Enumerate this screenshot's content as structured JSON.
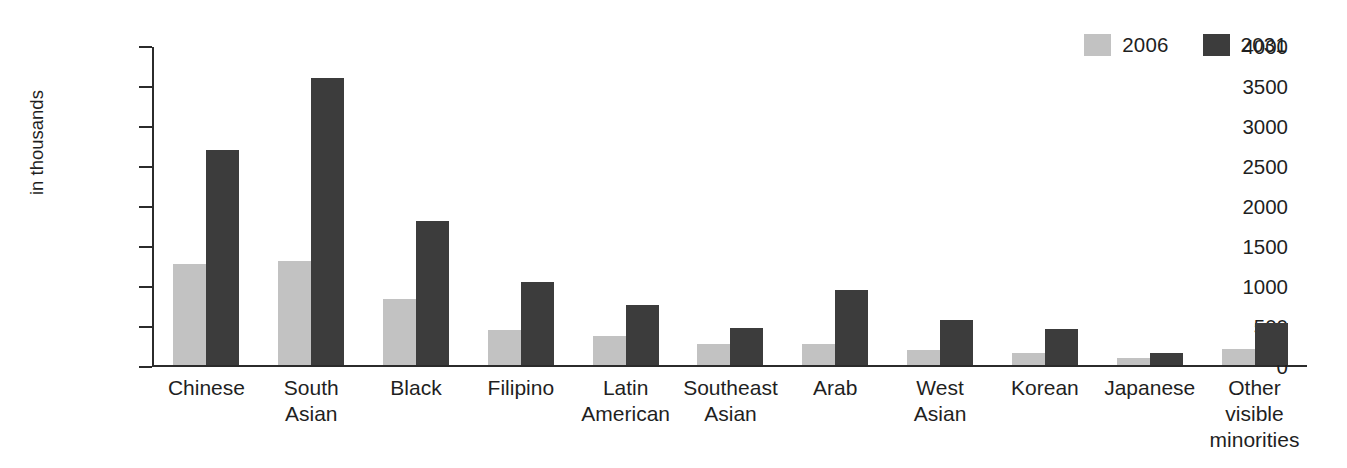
{
  "chart_data": {
    "type": "bar",
    "title": "",
    "xlabel": "",
    "ylabel": "in thousands",
    "ylim": [
      0,
      4000
    ],
    "yticks": [
      0,
      500,
      1000,
      1500,
      2000,
      2500,
      3000,
      3500,
      4000
    ],
    "grid": false,
    "legend_position": "top-right",
    "categories": [
      "Chinese",
      "South Asian",
      "Black",
      "Filipino",
      "Latin American",
      "Southeast Asian",
      "Arab",
      "West Asian",
      "Korean",
      "Japanese",
      "Other visible minorities"
    ],
    "category_lines": [
      [
        "Chinese"
      ],
      [
        "South",
        "Asian"
      ],
      [
        "Black"
      ],
      [
        "Filipino"
      ],
      [
        "Latin",
        "American"
      ],
      [
        "Southeast",
        "Asian"
      ],
      [
        "Arab"
      ],
      [
        "West",
        "Asian"
      ],
      [
        "Korean"
      ],
      [
        "Japanese"
      ],
      [
        "Other",
        "visible",
        "minorities"
      ]
    ],
    "series": [
      {
        "name": "2006",
        "color": "#c2c2c2",
        "values": [
          1270,
          1310,
          830,
          440,
          365,
          265,
          270,
          185,
          150,
          85,
          205
        ]
      },
      {
        "name": "2031",
        "color": "#3c3c3c",
        "values": [
          2710,
          3610,
          1810,
          1050,
          760,
          465,
          940,
          560,
          455,
          155,
          530
        ]
      }
    ]
  },
  "legend": {
    "entries": [
      {
        "label": "2006",
        "color": "#c2c2c2"
      },
      {
        "label": "2031",
        "color": "#3c3c3c"
      }
    ]
  },
  "axis": {
    "y_title": "in thousands",
    "y_ticks": [
      "4000",
      "3500",
      "3000",
      "2500",
      "2000",
      "1500",
      "1000",
      "500",
      "0"
    ]
  },
  "colors": {
    "series_2006": "#c2c2c2",
    "series_2031": "#3c3c3c",
    "axis": "#2b2b2b",
    "text": "#1f1f1f",
    "background": "#ffffff"
  }
}
